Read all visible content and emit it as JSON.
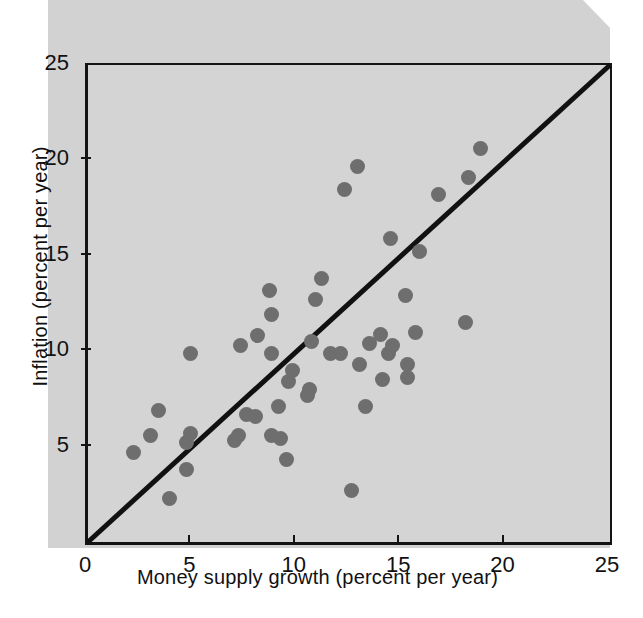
{
  "chart_data": {
    "type": "scatter",
    "title": "",
    "xlabel": "Money supply growth (percent per year)",
    "ylabel": "Inflation (percent per year)",
    "xlim": [
      0,
      25
    ],
    "ylim": [
      0,
      25
    ],
    "xticks": [
      0,
      5,
      10,
      15,
      20,
      25
    ],
    "yticks": [
      5,
      10,
      15,
      20,
      25
    ],
    "xtick_labels": [
      "0",
      "5",
      "10",
      "15",
      "20",
      "25"
    ],
    "ytick_labels": [
      "5",
      "10",
      "15",
      "20",
      "25"
    ],
    "grid": false,
    "legend": null,
    "annotations": [],
    "reference_line": {
      "name": "45-degree line",
      "from": [
        0,
        0
      ],
      "to": [
        25,
        25
      ],
      "color": "#111111",
      "width_px": 5
    },
    "marker": {
      "shape": "circle",
      "color": "#6e6e6e",
      "size_px": 15
    },
    "plot_background": "#d4d4d4",
    "points": [
      {
        "x": 2.2,
        "y": 4.7
      },
      {
        "x": 3.0,
        "y": 5.6
      },
      {
        "x": 3.4,
        "y": 6.9
      },
      {
        "x": 3.9,
        "y": 2.3
      },
      {
        "x": 4.7,
        "y": 3.8
      },
      {
        "x": 4.7,
        "y": 5.2
      },
      {
        "x": 4.9,
        "y": 5.7
      },
      {
        "x": 4.9,
        "y": 9.9
      },
      {
        "x": 7.0,
        "y": 5.3
      },
      {
        "x": 7.2,
        "y": 5.6
      },
      {
        "x": 7.3,
        "y": 10.3
      },
      {
        "x": 7.6,
        "y": 6.7
      },
      {
        "x": 8.0,
        "y": 6.6
      },
      {
        "x": 8.1,
        "y": 10.8
      },
      {
        "x": 8.7,
        "y": 13.2
      },
      {
        "x": 8.8,
        "y": 5.6
      },
      {
        "x": 8.8,
        "y": 9.9
      },
      {
        "x": 8.8,
        "y": 11.9
      },
      {
        "x": 9.1,
        "y": 7.1
      },
      {
        "x": 9.2,
        "y": 5.4
      },
      {
        "x": 9.5,
        "y": 4.3
      },
      {
        "x": 9.6,
        "y": 8.4
      },
      {
        "x": 9.8,
        "y": 9.0
      },
      {
        "x": 10.5,
        "y": 7.7
      },
      {
        "x": 10.6,
        "y": 8.0
      },
      {
        "x": 10.7,
        "y": 10.5
      },
      {
        "x": 10.9,
        "y": 12.7
      },
      {
        "x": 11.2,
        "y": 13.8
      },
      {
        "x": 11.6,
        "y": 9.9
      },
      {
        "x": 12.1,
        "y": 9.9
      },
      {
        "x": 12.3,
        "y": 18.5
      },
      {
        "x": 12.6,
        "y": 2.7
      },
      {
        "x": 12.9,
        "y": 19.7
      },
      {
        "x": 13.0,
        "y": 9.3
      },
      {
        "x": 13.3,
        "y": 7.1
      },
      {
        "x": 13.5,
        "y": 10.4
      },
      {
        "x": 14.0,
        "y": 10.9
      },
      {
        "x": 14.1,
        "y": 8.5
      },
      {
        "x": 14.4,
        "y": 9.9
      },
      {
        "x": 14.5,
        "y": 15.9
      },
      {
        "x": 14.6,
        "y": 10.3
      },
      {
        "x": 15.2,
        "y": 12.9
      },
      {
        "x": 15.3,
        "y": 8.6
      },
      {
        "x": 15.3,
        "y": 9.3
      },
      {
        "x": 15.7,
        "y": 11.0
      },
      {
        "x": 15.9,
        "y": 15.2
      },
      {
        "x": 16.8,
        "y": 18.2
      },
      {
        "x": 18.1,
        "y": 11.5
      },
      {
        "x": 18.2,
        "y": 19.1
      },
      {
        "x": 18.8,
        "y": 20.6
      }
    ]
  },
  "axes": {
    "x_title": "Money supply growth (percent per year)",
    "y_title": "Inflation (percent per year)",
    "x_ticks": [
      {
        "value": 0,
        "label": "0"
      },
      {
        "value": 5,
        "label": "5"
      },
      {
        "value": 10,
        "label": "10"
      },
      {
        "value": 15,
        "label": "15"
      },
      {
        "value": 20,
        "label": "20"
      },
      {
        "value": 25,
        "label": "25"
      }
    ],
    "y_ticks": [
      {
        "value": 5,
        "label": "5"
      },
      {
        "value": 10,
        "label": "10"
      },
      {
        "value": 15,
        "label": "15"
      },
      {
        "value": 20,
        "label": "20"
      },
      {
        "value": 25,
        "label": "25"
      }
    ]
  },
  "colors": {
    "marker": "#6e6e6e",
    "plot_background": "#d4d4d4",
    "page_background": "#ffffff",
    "scan_backdrop": "#d2d2d2",
    "axis": "#141414",
    "text": "#111111"
  }
}
